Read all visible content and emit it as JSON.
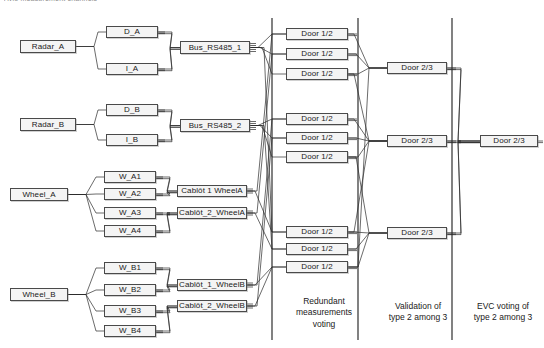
{
  "figure": {
    "clipped_header": "Avio measurement channels",
    "background": "#ffffff",
    "box_fill": "#f4f4f4",
    "box_stroke": "#4a4a4a",
    "line_color": "#2b2b2b",
    "separator_color": "#1a1a1a"
  },
  "columns": {
    "captions": [
      {
        "text": "Redundant\nmeasurements\nvoting",
        "x": 279,
        "y": 296,
        "w": 90
      },
      {
        "text": "Validation of\ntype 2 among 3",
        "x": 373,
        "y": 301,
        "w": 90
      },
      {
        "text": "EVC voting of\ntype 2 among 3",
        "x": 462,
        "y": 301,
        "w": 82
      }
    ],
    "separators": [
      {
        "x": 272,
        "y1": 18,
        "y2": 340
      },
      {
        "x": 358,
        "y1": 18,
        "y2": 340
      },
      {
        "x": 452,
        "y1": 18,
        "y2": 340
      }
    ]
  },
  "nodes": {
    "sources": [
      {
        "id": "radar-a",
        "label": "Radar_A",
        "x": 20,
        "y": 40,
        "w": 56,
        "h": 13
      },
      {
        "id": "radar-b",
        "label": "Radar_B",
        "x": 20,
        "y": 118,
        "w": 56,
        "h": 13
      },
      {
        "id": "wheel-a",
        "label": "Wheel_A",
        "x": 10,
        "y": 188,
        "w": 58,
        "h": 13
      },
      {
        "id": "wheel-b",
        "label": "Wheel_B",
        "x": 10,
        "y": 288,
        "w": 58,
        "h": 13
      }
    ],
    "channels": [
      {
        "id": "d-a",
        "label": "D_A",
        "x": 106,
        "y": 26,
        "w": 52,
        "h": 12
      },
      {
        "id": "i-a",
        "label": "I_A",
        "x": 106,
        "y": 63,
        "w": 52,
        "h": 12
      },
      {
        "id": "d-b",
        "label": "D_B",
        "x": 106,
        "y": 104,
        "w": 52,
        "h": 12
      },
      {
        "id": "i-b",
        "label": "I_B",
        "x": 106,
        "y": 134,
        "w": 52,
        "h": 12
      },
      {
        "id": "w-a1",
        "label": "W_A1",
        "x": 104,
        "y": 171,
        "w": 52,
        "h": 12
      },
      {
        "id": "w-a2",
        "label": "W_A2",
        "x": 104,
        "y": 188,
        "w": 52,
        "h": 12
      },
      {
        "id": "w-a3",
        "label": "W_A3",
        "x": 104,
        "y": 207,
        "w": 52,
        "h": 12
      },
      {
        "id": "w-a4",
        "label": "W_A4",
        "x": 104,
        "y": 225,
        "w": 52,
        "h": 12
      },
      {
        "id": "w-b1",
        "label": "W_B1",
        "x": 104,
        "y": 262,
        "w": 52,
        "h": 12
      },
      {
        "id": "w-b2",
        "label": "W_B2",
        "x": 104,
        "y": 284,
        "w": 52,
        "h": 12
      },
      {
        "id": "w-b3",
        "label": "W_B3",
        "x": 104,
        "y": 305,
        "w": 52,
        "h": 12
      },
      {
        "id": "w-b4",
        "label": "W_B4",
        "x": 104,
        "y": 325,
        "w": 52,
        "h": 12
      }
    ],
    "buses": [
      {
        "id": "bus-rs485-1",
        "label": "Bus_RS485_1",
        "x": 180,
        "y": 41,
        "w": 70,
        "h": 13
      },
      {
        "id": "bus-rs485-2",
        "label": "Bus_RS485_2",
        "x": 180,
        "y": 119,
        "w": 70,
        "h": 13
      },
      {
        "id": "cablot-1-wheela",
        "label": "Cablôt 1 WheelA",
        "x": 177,
        "y": 185,
        "w": 70,
        "h": 12
      },
      {
        "id": "cablot-2-wheela",
        "label": "Cablôt_2_WheelA",
        "x": 177,
        "y": 207,
        "w": 70,
        "h": 12
      },
      {
        "id": "cablot-1-wheelb",
        "label": "Cablôt_1_WheelB",
        "x": 177,
        "y": 279,
        "w": 70,
        "h": 12
      },
      {
        "id": "cablot-2-wheelb",
        "label": "Cablôt_2_WheelB",
        "x": 177,
        "y": 300,
        "w": 70,
        "h": 12
      }
    ],
    "door12": [
      {
        "id": "door12-1",
        "label": "Door 1/2",
        "x": 286,
        "y": 28,
        "w": 62,
        "h": 12
      },
      {
        "id": "door12-2",
        "label": "Door 1/2",
        "x": 286,
        "y": 48,
        "w": 62,
        "h": 12
      },
      {
        "id": "door12-3",
        "label": "Door 1/2",
        "x": 286,
        "y": 68,
        "w": 62,
        "h": 12
      },
      {
        "id": "door12-4",
        "label": "Door 1/2",
        "x": 286,
        "y": 113,
        "w": 62,
        "h": 12
      },
      {
        "id": "door12-5",
        "label": "Door 1/2",
        "x": 286,
        "y": 132,
        "w": 62,
        "h": 12
      },
      {
        "id": "door12-6",
        "label": "Door 1/2",
        "x": 286,
        "y": 151,
        "w": 62,
        "h": 12
      },
      {
        "id": "door12-7",
        "label": "Door 1/2",
        "x": 286,
        "y": 226,
        "w": 62,
        "h": 12
      },
      {
        "id": "door12-8",
        "label": "Door 1/2",
        "x": 286,
        "y": 243,
        "w": 62,
        "h": 12
      },
      {
        "id": "door12-9",
        "label": "Door 1/2",
        "x": 286,
        "y": 261,
        "w": 62,
        "h": 12
      }
    ],
    "door23": [
      {
        "id": "door23-1",
        "label": "Door 2/3",
        "x": 387,
        "y": 62,
        "w": 60,
        "h": 12
      },
      {
        "id": "door23-2",
        "label": "Door 2/3",
        "x": 387,
        "y": 135,
        "w": 60,
        "h": 12
      },
      {
        "id": "door23-3",
        "label": "Door 2/3",
        "x": 387,
        "y": 227,
        "w": 60,
        "h": 12
      }
    ],
    "final": [
      {
        "id": "door23-final",
        "label": "Door 2/3",
        "x": 480,
        "y": 135,
        "w": 58,
        "h": 12
      }
    ]
  },
  "edges": {
    "source_fan": [
      {
        "from": "radar-a",
        "to": "d-a"
      },
      {
        "from": "radar-a",
        "to": "i-a"
      },
      {
        "from": "radar-b",
        "to": "d-b"
      },
      {
        "from": "radar-b",
        "to": "i-b"
      },
      {
        "from": "wheel-a",
        "to": "w-a1"
      },
      {
        "from": "wheel-a",
        "to": "w-a2"
      },
      {
        "from": "wheel-a",
        "to": "w-a3"
      },
      {
        "from": "wheel-a",
        "to": "w-a4"
      },
      {
        "from": "wheel-b",
        "to": "w-b1"
      },
      {
        "from": "wheel-b",
        "to": "w-b2"
      },
      {
        "from": "wheel-b",
        "to": "w-b3"
      },
      {
        "from": "wheel-b",
        "to": "w-b4"
      }
    ],
    "channel_to_bus": [
      {
        "from": "d-a",
        "to": "bus-rs485-1"
      },
      {
        "from": "i-a",
        "to": "bus-rs485-1"
      },
      {
        "from": "d-b",
        "to": "bus-rs485-2"
      },
      {
        "from": "i-b",
        "to": "bus-rs485-2"
      },
      {
        "from": "w-a1",
        "to": "cablot-1-wheela"
      },
      {
        "from": "w-a2",
        "to": "cablot-1-wheela"
      },
      {
        "from": "w-a3",
        "to": "cablot-2-wheela"
      },
      {
        "from": "w-a4",
        "to": "cablot-2-wheela"
      },
      {
        "from": "w-b1",
        "to": "cablot-1-wheelb"
      },
      {
        "from": "w-b2",
        "to": "cablot-1-wheelb"
      },
      {
        "from": "w-b3",
        "to": "cablot-2-wheelb"
      },
      {
        "from": "w-b4",
        "to": "cablot-2-wheelb"
      }
    ],
    "bus_to_door12_crossing": true,
    "door12_to_door23_crossing": true,
    "door23_to_final": [
      {
        "from": "door23-1",
        "to": "door23-final"
      },
      {
        "from": "door23-2",
        "to": "door23-final"
      },
      {
        "from": "door23-3",
        "to": "door23-final"
      }
    ]
  }
}
